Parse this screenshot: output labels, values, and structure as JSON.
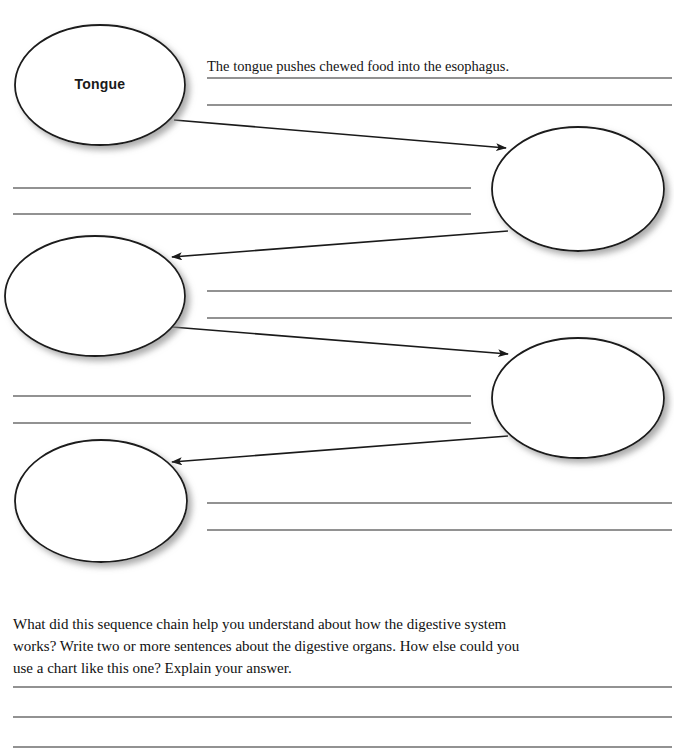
{
  "page": {
    "type": "sequence-chain-worksheet",
    "width": 674,
    "height": 753,
    "background_color": "#ffffff",
    "line_color": "#6e6e6e",
    "stroke_color": "#1a1a1a"
  },
  "nodes": [
    {
      "id": "node-1",
      "label": "Tongue",
      "filled": true,
      "cx": 100,
      "cy": 85,
      "rx": 85,
      "ry": 60
    },
    {
      "id": "node-2",
      "label": "",
      "filled": false,
      "cx": 578,
      "cy": 189,
      "rx": 86,
      "ry": 62
    },
    {
      "id": "node-3",
      "label": "",
      "filled": false,
      "cx": 95,
      "cy": 296,
      "rx": 90,
      "ry": 60
    },
    {
      "id": "node-4",
      "label": "",
      "filled": false,
      "cx": 578,
      "cy": 398,
      "rx": 86,
      "ry": 60
    },
    {
      "id": "node-5",
      "label": "",
      "filled": false,
      "cx": 101,
      "cy": 501,
      "rx": 86,
      "ry": 61
    }
  ],
  "arrows": [
    {
      "id": "arrow-1",
      "from": "node-1",
      "to": "node-2",
      "x1": 174,
      "y1": 120,
      "x2": 506,
      "y2": 148
    },
    {
      "id": "arrow-2",
      "from": "node-2",
      "to": "node-3",
      "x1": 508,
      "y1": 231,
      "x2": 172,
      "y2": 257
    },
    {
      "id": "arrow-3",
      "from": "node-3",
      "to": "node-4",
      "x1": 172,
      "y1": 327,
      "x2": 508,
      "y2": 354
    },
    {
      "id": "arrow-4",
      "from": "node-4",
      "to": "node-5",
      "x1": 508,
      "y1": 436,
      "x2": 172,
      "y2": 462
    }
  ],
  "writing_line_groups": [
    {
      "id": "lines-node-1",
      "side": "right",
      "x1": 207,
      "x2": 672,
      "ys": [
        78,
        105
      ],
      "answer": {
        "text": "The tongue pushes chewed food into the esophagus.",
        "x": 207,
        "y": 58
      }
    },
    {
      "id": "lines-node-2",
      "side": "left",
      "x1": 13,
      "x2": 471,
      "ys": [
        188,
        214
      ],
      "answer": {
        "text": "",
        "x": 13,
        "y": 168
      }
    },
    {
      "id": "lines-node-3",
      "side": "right",
      "x1": 207,
      "x2": 672,
      "ys": [
        291,
        318
      ],
      "answer": {
        "text": "",
        "x": 207,
        "y": 271
      }
    },
    {
      "id": "lines-node-4",
      "side": "left",
      "x1": 13,
      "x2": 471,
      "ys": [
        396,
        423
      ],
      "answer": {
        "text": "",
        "x": 13,
        "y": 376
      }
    },
    {
      "id": "lines-node-5",
      "side": "right",
      "x1": 207,
      "x2": 672,
      "ys": [
        503,
        530
      ],
      "answer": {
        "text": "",
        "x": 207,
        "y": 483
      }
    }
  ],
  "prompt": {
    "text": "What did this sequence chain help you understand about how the digestive system works? Write two or more sentences about the digestive organs. How else could you use a chart like this one? Explain your answer."
  },
  "response_lines": {
    "x1": 13,
    "x2": 672,
    "ys": [
      687,
      717,
      747
    ]
  }
}
